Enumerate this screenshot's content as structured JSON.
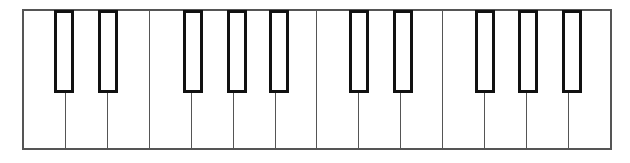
{
  "figure": {
    "name": "piano-keyboard-diagram",
    "width": 630,
    "height": 163,
    "background_color": "#ffffff"
  },
  "keyboard": {
    "frame": {
      "x": 22,
      "y": 9,
      "width": 590,
      "height": 141,
      "border_color": "#555555",
      "border_width": 2,
      "fill_color": "#ffffff"
    },
    "white_keys": {
      "count": 14,
      "top": 9,
      "left": 22,
      "width": 42.15,
      "height": 141,
      "fill_color": "#ffffff",
      "border_color": "#555555",
      "border_width": 1,
      "labels": [
        "C",
        "D",
        "E",
        "F",
        "G",
        "A",
        "B",
        "C",
        "D",
        "E",
        "F",
        "G",
        "A",
        "B"
      ],
      "divider_positions": [
        64.7,
        107.3,
        150.3,
        192.7,
        235.3,
        278.7,
        321.3,
        358.7,
        401.3,
        444.7,
        485.3,
        529.3,
        572.0
      ]
    },
    "black_keys": {
      "count": 10,
      "top": 9,
      "height": 83,
      "width": 20,
      "fill_color": "#ffffff",
      "border_color": "#111111",
      "border_width": 3,
      "groups": [
        2,
        3,
        2,
        3
      ],
      "labels": [
        "C#",
        "D#",
        "F#",
        "G#",
        "A#",
        "C#",
        "D#",
        "F#",
        "G#",
        "A#"
      ],
      "positions": [
        54,
        98,
        183.3,
        226.7,
        269.3,
        349.3,
        392.7,
        475,
        518.3,
        561.7
      ]
    }
  }
}
